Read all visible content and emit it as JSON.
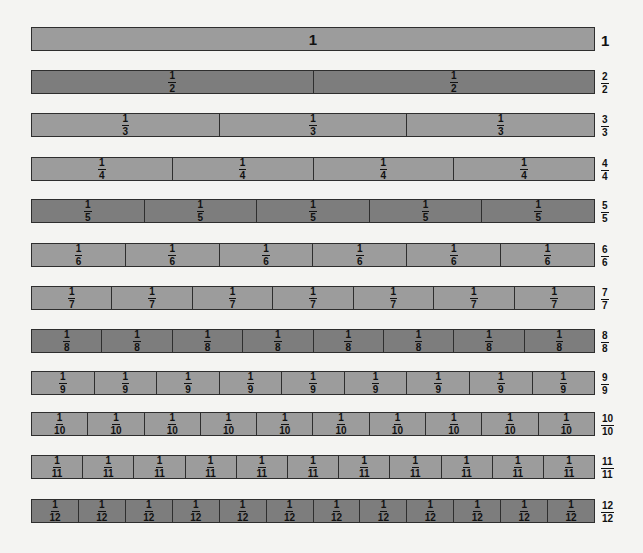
{
  "diagram": {
    "strips": [
      {
        "denominator": 1,
        "shade": "light",
        "cell_label": "1",
        "total_label": "1",
        "top": 27
      },
      {
        "denominator": 2,
        "shade": "dark",
        "cell_label": {
          "num": "1",
          "den": "2"
        },
        "total_label": {
          "num": "2",
          "den": "2"
        },
        "top": 70
      },
      {
        "denominator": 3,
        "shade": "light",
        "cell_label": {
          "num": "1",
          "den": "3"
        },
        "total_label": {
          "num": "3",
          "den": "3"
        },
        "top": 113
      },
      {
        "denominator": 4,
        "shade": "light",
        "cell_label": {
          "num": "1",
          "den": "4"
        },
        "total_label": {
          "num": "4",
          "den": "4"
        },
        "top": 157
      },
      {
        "denominator": 5,
        "shade": "dark",
        "cell_label": {
          "num": "1",
          "den": "5"
        },
        "total_label": {
          "num": "5",
          "den": "5"
        },
        "top": 199
      },
      {
        "denominator": 6,
        "shade": "light",
        "cell_label": {
          "num": "1",
          "den": "6"
        },
        "total_label": {
          "num": "6",
          "den": "6"
        },
        "top": 243
      },
      {
        "denominator": 7,
        "shade": "light",
        "cell_label": {
          "num": "1",
          "den": "7"
        },
        "total_label": {
          "num": "7",
          "den": "7"
        },
        "top": 286
      },
      {
        "denominator": 8,
        "shade": "dark",
        "cell_label": {
          "num": "1",
          "den": "8"
        },
        "total_label": {
          "num": "8",
          "den": "8"
        },
        "top": 329
      },
      {
        "denominator": 9,
        "shade": "light",
        "cell_label": {
          "num": "1",
          "den": "9"
        },
        "total_label": {
          "num": "9",
          "den": "9"
        },
        "top": 371
      },
      {
        "denominator": 10,
        "shade": "light",
        "cell_label": {
          "num": "1",
          "den": "10"
        },
        "total_label": {
          "num": "10",
          "den": "10"
        },
        "top": 412
      },
      {
        "denominator": 11,
        "shade": "light",
        "cell_label": {
          "num": "1",
          "den": "11"
        },
        "total_label": {
          "num": "11",
          "den": "11"
        },
        "top": 455
      },
      {
        "denominator": 12,
        "shade": "dark",
        "cell_label": {
          "num": "1",
          "den": "12"
        },
        "total_label": {
          "num": "12",
          "den": "12"
        },
        "top": 499
      }
    ],
    "colors": {
      "light_fill": "#9c9c9c",
      "dark_fill": "#7d7d7d",
      "border": "#2e2e2e",
      "background": "#f4f4f2",
      "text": "#111111"
    }
  }
}
